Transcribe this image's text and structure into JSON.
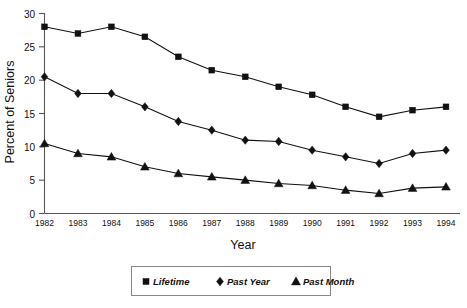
{
  "chart_data": {
    "type": "line",
    "title": "",
    "xlabel": "Year",
    "ylabel": "Percent of Seniors",
    "categories": [
      "1982",
      "1983",
      "1984",
      "1985",
      "1986",
      "1987",
      "1988",
      "1989",
      "1990",
      "1991",
      "1992",
      "1993",
      "1994"
    ],
    "x": [
      1982,
      1983,
      1984,
      1985,
      1986,
      1987,
      1988,
      1989,
      1990,
      1991,
      1992,
      1993,
      1994
    ],
    "xlim": [
      1982,
      1994
    ],
    "ylim": [
      0,
      30
    ],
    "yticks": [
      0,
      5,
      10,
      15,
      20,
      25,
      30
    ],
    "ytick_labels": [
      "0",
      "5",
      "10",
      "15",
      "20",
      "25",
      "30"
    ],
    "grid": false,
    "legend_position": "bottom",
    "series": [
      {
        "name": "Lifetime",
        "marker": "square",
        "values": [
          28.0,
          27.0,
          28.0,
          26.5,
          23.5,
          21.5,
          20.5,
          19.0,
          17.8,
          16.0,
          14.5,
          15.5,
          16.0
        ]
      },
      {
        "name": "Past Year",
        "marker": "diamond",
        "values": [
          20.5,
          18.0,
          18.0,
          16.0,
          13.8,
          12.5,
          11.0,
          10.8,
          9.5,
          8.5,
          7.5,
          9.0,
          9.5
        ]
      },
      {
        "name": "Past Month",
        "marker": "triangle",
        "values": [
          10.5,
          9.0,
          8.5,
          7.0,
          6.0,
          5.5,
          5.0,
          4.5,
          4.2,
          3.5,
          3.0,
          3.8,
          4.0
        ]
      }
    ]
  },
  "axes": {
    "y_title": "Percent of Seniors",
    "x_title": "Year"
  },
  "legend": {
    "items": [
      {
        "label": "Lifetime",
        "marker": "square-marker-icon"
      },
      {
        "label": "Past Year",
        "marker": "diamond-marker-icon"
      },
      {
        "label": "Past Month",
        "marker": "triangle-marker-icon"
      }
    ]
  }
}
